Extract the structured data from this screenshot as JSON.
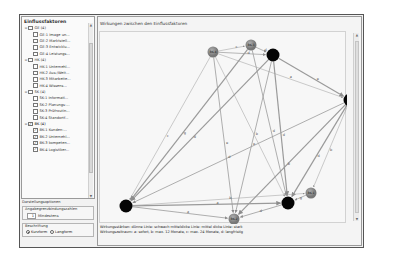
{
  "left_panel": {
    "title": "Einflussfaktoren",
    "tree": [
      {
        "label": "GE (4)",
        "checked": false,
        "level": 0,
        "expanded": true
      },
      {
        "label": "GE-1 Image un...",
        "checked": false,
        "level": 1
      },
      {
        "label": "GE-2 Marktstell...",
        "checked": false,
        "level": 1
      },
      {
        "label": "GE-3 Entwicklu...",
        "checked": false,
        "level": 1
      },
      {
        "label": "GE-4 Leistungs...",
        "checked": false,
        "level": 1
      },
      {
        "label": "HK (4)",
        "checked": false,
        "level": 0,
        "expanded": true
      },
      {
        "label": "HK-1 Unternehl...",
        "checked": false,
        "level": 1
      },
      {
        "label": "HK-2 Aus-/Weit...",
        "checked": false,
        "level": 1
      },
      {
        "label": "HK-3 Mitarbeite...",
        "checked": false,
        "level": 1
      },
      {
        "label": "HK-4 Wissens...",
        "checked": false,
        "level": 1
      },
      {
        "label": "SK (4)",
        "checked": false,
        "level": 0,
        "expanded": true
      },
      {
        "label": "SK-1 Informati...",
        "checked": false,
        "level": 1
      },
      {
        "label": "SK-2 Planungs-...",
        "checked": false,
        "level": 1
      },
      {
        "label": "SK-3 Prüfroutin...",
        "checked": false,
        "level": 1
      },
      {
        "label": "SK-4 Standortf...",
        "checked": false,
        "level": 1
      },
      {
        "label": "BK (4)",
        "checked": true,
        "level": 0,
        "expanded": true,
        "selected": true
      },
      {
        "label": "BK-1 Kunden-...",
        "checked": true,
        "level": 1
      },
      {
        "label": "BK-2 Unternehl...",
        "checked": true,
        "level": 1
      },
      {
        "label": "BK-3 kompeten...",
        "checked": true,
        "level": 1
      },
      {
        "label": "BK-4 Logistiker...",
        "checked": true,
        "level": 1
      }
    ],
    "settings_label": "Darstellungsoptionen",
    "threshold_group": {
      "title": "Angabegrenzbindungszahlen",
      "value": "1",
      "unit": "Mindestens"
    },
    "labeling_group": {
      "title": "Beschriftung",
      "options": [
        {
          "label": "Kurzform",
          "selected": true
        },
        {
          "label": "Langform",
          "selected": false
        }
      ]
    }
  },
  "main_panel": {
    "title": "Wirkungen zwischen den Einflussfaktoren",
    "legend_line1": "Wirkungsstärken:  dünne Linie: schwach  mitteldicke Linie: mittel  dicke Linie: stark",
    "legend_line2": "Wirkungszeitraum: a: sofort,  b: max. 12 Monate,  c: max. 24 Monate,  d: langfristig"
  },
  "graph": {
    "nodes": [
      {
        "id": "BK-4",
        "label": "BK-4",
        "x": 113,
        "y": 20,
        "r": 5.5,
        "color": "#8a8a8a"
      },
      {
        "id": "BK-3",
        "label": "BK-3",
        "x": 151,
        "y": 13,
        "r": 5.5,
        "color": "#8a8a8a"
      },
      {
        "id": "N1",
        "label": "",
        "x": 173,
        "y": 23,
        "r": 6.5,
        "color": "#050505"
      },
      {
        "id": "N2",
        "label": "",
        "x": 250,
        "y": 68,
        "r": 6.5,
        "color": "#050505"
      },
      {
        "id": "BK-1",
        "label": "BK-1",
        "x": 211,
        "y": 161,
        "r": 5.5,
        "color": "#8a8a8a"
      },
      {
        "id": "N3",
        "label": "",
        "x": 188,
        "y": 171,
        "r": 6.5,
        "color": "#050505"
      },
      {
        "id": "BK-2",
        "label": "BK-2",
        "x": 134,
        "y": 187,
        "r": 5.5,
        "color": "#8a8a8a"
      },
      {
        "id": "N4",
        "label": "",
        "x": 26,
        "y": 174,
        "r": 6.5,
        "color": "#050505"
      }
    ],
    "edges": [
      {
        "from": "BK-4",
        "to": "BK-3",
        "label": "c",
        "w": 0.5
      },
      {
        "from": "BK-4",
        "to": "N1",
        "label": "d",
        "w": 0.7
      },
      {
        "from": "BK-3",
        "to": "N1",
        "label": "d",
        "w": 0.7
      },
      {
        "from": "N1",
        "to": "N2",
        "label": "e",
        "w": 1.2
      },
      {
        "from": "BK-4",
        "to": "N2",
        "label": "a",
        "w": 0.5
      },
      {
        "from": "N1",
        "to": "N4",
        "label": "d",
        "w": 1.2
      },
      {
        "from": "BK-3",
        "to": "N4",
        "label": "g",
        "w": 1.2
      },
      {
        "from": "BK-4",
        "to": "N4",
        "label": "c",
        "w": 0.5
      },
      {
        "from": "BK-4",
        "to": "BK-2",
        "label": "e",
        "w": 0.8
      },
      {
        "from": "N1",
        "to": "BK-2",
        "label": "e",
        "w": 0.8
      },
      {
        "from": "N1",
        "to": "N3",
        "label": "d",
        "w": 1.2
      },
      {
        "from": "BK-3",
        "to": "N3",
        "label": "d",
        "w": 0.8
      },
      {
        "from": "BK-4",
        "to": "N3",
        "label": "b",
        "w": 0.5
      },
      {
        "from": "N2",
        "to": "N4",
        "label": "d",
        "w": 0.8
      },
      {
        "from": "N2",
        "to": "BK-2",
        "label": "b",
        "w": 1.2
      },
      {
        "from": "N2",
        "to": "N3",
        "label": "d",
        "w": 1.2
      },
      {
        "from": "N2",
        "to": "BK-1",
        "label": "b",
        "w": 0.5
      },
      {
        "from": "N4",
        "to": "N3",
        "label": "a",
        "w": 1.2
      },
      {
        "from": "N4",
        "to": "BK-1",
        "label": "b",
        "w": 0.5
      },
      {
        "from": "N4",
        "to": "BK-2",
        "label": "a",
        "w": 0.8
      },
      {
        "from": "N3",
        "to": "BK-2",
        "label": "d",
        "w": 0.8
      },
      {
        "from": "BK-1",
        "to": "N3",
        "label": "g",
        "w": 0.7
      }
    ]
  }
}
